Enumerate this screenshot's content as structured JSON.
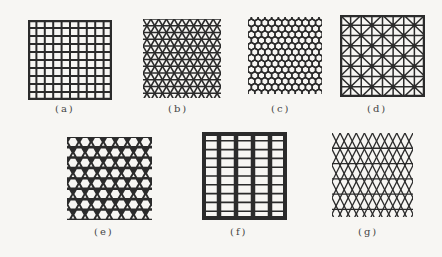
{
  "figure": {
    "background": "#f7f6f3",
    "line_color": "#2b2b2b",
    "panels": [
      {
        "id": "a",
        "label": "(a)",
        "pattern": "square-grid",
        "x": 28,
        "y": 20,
        "w": 84,
        "h": 80,
        "cells": 10,
        "cap_x": 55,
        "cap_y": 103
      },
      {
        "id": "b",
        "label": "(b)",
        "pattern": "triangular",
        "x": 143,
        "y": 19,
        "w": 78,
        "h": 79,
        "cap_x": 168,
        "cap_y": 103
      },
      {
        "id": "c",
        "label": "(c)",
        "pattern": "honeycomb",
        "x": 248,
        "y": 17,
        "w": 74,
        "h": 77,
        "cap_x": 271,
        "cap_y": 103
      },
      {
        "id": "d",
        "label": "(d)",
        "pattern": "square-with-diagonals",
        "x": 340,
        "y": 15,
        "w": 85,
        "h": 82,
        "cap_x": 367,
        "cap_y": 103
      },
      {
        "id": "e",
        "label": "(e)",
        "pattern": "kagome",
        "x": 67,
        "y": 137,
        "w": 85,
        "h": 83,
        "cap_x": 94,
        "cap_y": 226
      },
      {
        "id": "f",
        "label": "(f)",
        "pattern": "rectangular-grid",
        "x": 202,
        "y": 132,
        "w": 85,
        "h": 88,
        "cap_x": 230,
        "cap_y": 226
      },
      {
        "id": "g",
        "label": "(g)",
        "pattern": "diamond-with-horizontals",
        "x": 332,
        "y": 133,
        "w": 81,
        "h": 84,
        "cap_x": 358,
        "cap_y": 226
      }
    ]
  }
}
